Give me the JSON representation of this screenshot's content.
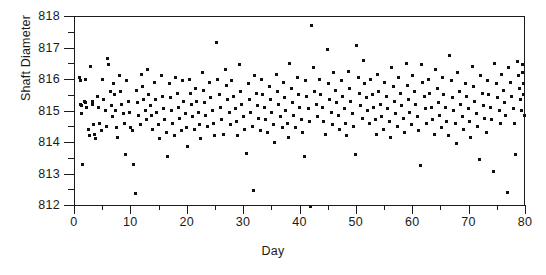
{
  "chart_data": {
    "type": "scatter",
    "title": "",
    "xlabel": "Day",
    "ylabel": "Shaft Diameter",
    "xlim": [
      0,
      80
    ],
    "ylim": [
      812,
      818
    ],
    "grid": false,
    "legend": null,
    "marker": "square",
    "marker_color": "#101010",
    "marker_size_px": 3,
    "xticks": [
      0,
      10,
      20,
      30,
      40,
      50,
      60,
      70,
      80
    ],
    "xtick_labels": [
      "0",
      "10",
      "20",
      "30",
      "40",
      "50",
      "60",
      "70",
      "80"
    ],
    "xminor_ticks": [
      5,
      15,
      25,
      35,
      45,
      55,
      65,
      75
    ],
    "yticks": [
      812,
      813,
      814,
      815,
      816,
      817,
      818
    ],
    "ytick_labels": [
      "812",
      "813",
      "814",
      "815",
      "816",
      "817",
      "818"
    ],
    "yminor_ticks": [
      812.5,
      813.5,
      814.5,
      815.5,
      816.5,
      817.5
    ],
    "points": [
      [
        1.0,
        816.05
      ],
      [
        1.1,
        815.95
      ],
      [
        1.2,
        815.2
      ],
      [
        1.3,
        815.15
      ],
      [
        1.4,
        814.9
      ],
      [
        1.5,
        813.3
      ],
      [
        1.8,
        815.3
      ],
      [
        2.0,
        816.0
      ],
      [
        2.1,
        815.25
      ],
      [
        2.3,
        815.1
      ],
      [
        2.5,
        814.4
      ],
      [
        2.7,
        814.2
      ],
      [
        3.0,
        816.4
      ],
      [
        3.2,
        815.3
      ],
      [
        3.3,
        815.2
      ],
      [
        3.5,
        814.55
      ],
      [
        3.7,
        814.25
      ],
      [
        3.9,
        814.1
      ],
      [
        4.2,
        815.45
      ],
      [
        4.4,
        815.1
      ],
      [
        4.6,
        814.6
      ],
      [
        4.8,
        814.35
      ],
      [
        5.0,
        816.0
      ],
      [
        5.2,
        815.35
      ],
      [
        5.5,
        815.0
      ],
      [
        5.7,
        814.5
      ],
      [
        6.0,
        816.65
      ],
      [
        6.2,
        816.45
      ],
      [
        6.4,
        815.6
      ],
      [
        6.6,
        815.15
      ],
      [
        6.8,
        814.8
      ],
      [
        7.0,
        815.85
      ],
      [
        7.2,
        815.5
      ],
      [
        7.4,
        815.0
      ],
      [
        7.6,
        814.45
      ],
      [
        7.8,
        814.15
      ],
      [
        8.0,
        816.1
      ],
      [
        8.3,
        815.6
      ],
      [
        8.5,
        815.2
      ],
      [
        8.7,
        814.9
      ],
      [
        8.9,
        814.6
      ],
      [
        9.1,
        813.6
      ],
      [
        9.4,
        815.95
      ],
      [
        9.6,
        815.3
      ],
      [
        9.8,
        814.95
      ],
      [
        10.0,
        814.45
      ],
      [
        10.3,
        814.35
      ],
      [
        10.6,
        813.3
      ],
      [
        10.9,
        812.35
      ],
      [
        11.1,
        815.65
      ],
      [
        11.3,
        815.25
      ],
      [
        11.5,
        814.85
      ],
      [
        11.8,
        814.55
      ],
      [
        12.0,
        816.15
      ],
      [
        12.2,
        815.75
      ],
      [
        12.4,
        815.35
      ],
      [
        12.6,
        815.0
      ],
      [
        12.8,
        814.7
      ],
      [
        13.0,
        816.3
      ],
      [
        13.3,
        815.5
      ],
      [
        13.5,
        815.15
      ],
      [
        13.7,
        814.85
      ],
      [
        13.9,
        814.4
      ],
      [
        14.2,
        815.9
      ],
      [
        14.5,
        815.35
      ],
      [
        14.7,
        814.95
      ],
      [
        15.0,
        814.55
      ],
      [
        15.2,
        814.1
      ],
      [
        15.5,
        816.1
      ],
      [
        15.7,
        815.45
      ],
      [
        15.9,
        815.05
      ],
      [
        16.1,
        814.7
      ],
      [
        16.4,
        814.3
      ],
      [
        16.6,
        813.55
      ],
      [
        16.9,
        815.85
      ],
      [
        17.1,
        815.4
      ],
      [
        17.3,
        815.0
      ],
      [
        17.5,
        814.6
      ],
      [
        17.8,
        814.2
      ],
      [
        18.0,
        816.05
      ],
      [
        18.3,
        815.55
      ],
      [
        18.5,
        815.1
      ],
      [
        18.7,
        814.75
      ],
      [
        19.0,
        814.35
      ],
      [
        19.3,
        815.95
      ],
      [
        19.5,
        815.3
      ],
      [
        19.7,
        814.9
      ],
      [
        19.9,
        814.45
      ],
      [
        20.1,
        813.85
      ],
      [
        20.4,
        816.0
      ],
      [
        20.6,
        815.55
      ],
      [
        20.8,
        815.2
      ],
      [
        21.0,
        814.8
      ],
      [
        21.3,
        814.4
      ],
      [
        21.6,
        815.7
      ],
      [
        21.8,
        815.3
      ],
      [
        22.0,
        814.95
      ],
      [
        22.2,
        814.55
      ],
      [
        22.5,
        814.1
      ],
      [
        22.8,
        816.2
      ],
      [
        23.0,
        815.65
      ],
      [
        23.2,
        815.25
      ],
      [
        23.4,
        814.85
      ],
      [
        23.7,
        814.5
      ],
      [
        24.0,
        815.9
      ],
      [
        24.3,
        815.4
      ],
      [
        24.5,
        815.0
      ],
      [
        24.7,
        814.6
      ],
      [
        25.0,
        814.2
      ],
      [
        25.3,
        817.15
      ],
      [
        25.5,
        816.0
      ],
      [
        25.8,
        815.5
      ],
      [
        26.0,
        815.1
      ],
      [
        26.2,
        814.7
      ],
      [
        26.5,
        814.25
      ],
      [
        26.8,
        816.3
      ],
      [
        27.0,
        815.8
      ],
      [
        27.3,
        815.35
      ],
      [
        27.5,
        814.95
      ],
      [
        27.8,
        814.55
      ],
      [
        28.0,
        815.95
      ],
      [
        28.3,
        815.45
      ],
      [
        28.6,
        815.05
      ],
      [
        28.8,
        814.65
      ],
      [
        29.0,
        814.2
      ],
      [
        29.3,
        816.45
      ],
      [
        29.6,
        815.6
      ],
      [
        29.8,
        815.2
      ],
      [
        30.0,
        814.8
      ],
      [
        30.3,
        814.4
      ],
      [
        30.6,
        813.65
      ],
      [
        30.9,
        815.85
      ],
      [
        31.1,
        815.35
      ],
      [
        31.3,
        814.95
      ],
      [
        31.6,
        814.5
      ],
      [
        31.8,
        812.45
      ],
      [
        32.0,
        816.1
      ],
      [
        32.3,
        815.55
      ],
      [
        32.5,
        815.15
      ],
      [
        32.8,
        814.75
      ],
      [
        33.0,
        814.35
      ],
      [
        33.3,
        816.0
      ],
      [
        33.5,
        815.5
      ],
      [
        33.8,
        815.1
      ],
      [
        34.0,
        814.7
      ],
      [
        34.3,
        814.3
      ],
      [
        34.6,
        815.75
      ],
      [
        34.8,
        815.35
      ],
      [
        35.0,
        814.95
      ],
      [
        35.3,
        814.55
      ],
      [
        35.6,
        814.0
      ],
      [
        35.9,
        816.15
      ],
      [
        36.1,
        815.6
      ],
      [
        36.3,
        815.2
      ],
      [
        36.6,
        814.8
      ],
      [
        36.9,
        814.45
      ],
      [
        37.1,
        815.9
      ],
      [
        37.4,
        815.4
      ],
      [
        37.6,
        815.0
      ],
      [
        37.8,
        814.6
      ],
      [
        38.0,
        814.15
      ],
      [
        38.3,
        816.5
      ],
      [
        38.6,
        815.7
      ],
      [
        38.8,
        815.25
      ],
      [
        39.0,
        814.85
      ],
      [
        39.3,
        814.45
      ],
      [
        39.6,
        816.05
      ],
      [
        39.8,
        815.5
      ],
      [
        40.0,
        815.1
      ],
      [
        40.3,
        814.7
      ],
      [
        40.6,
        814.3
      ],
      [
        40.9,
        813.55
      ],
      [
        41.1,
        815.95
      ],
      [
        41.3,
        815.45
      ],
      [
        41.6,
        815.05
      ],
      [
        41.8,
        814.65
      ],
      [
        42.0,
        811.95
      ],
      [
        42.2,
        817.7
      ],
      [
        42.5,
        816.35
      ],
      [
        42.7,
        815.6
      ],
      [
        43.0,
        815.2
      ],
      [
        43.2,
        814.8
      ],
      [
        43.5,
        816.0
      ],
      [
        43.8,
        815.5
      ],
      [
        44.0,
        815.1
      ],
      [
        44.3,
        814.65
      ],
      [
        44.6,
        814.25
      ],
      [
        44.9,
        816.95
      ],
      [
        45.1,
        815.85
      ],
      [
        45.4,
        815.35
      ],
      [
        45.6,
        814.95
      ],
      [
        45.9,
        814.55
      ],
      [
        46.1,
        816.2
      ],
      [
        46.4,
        815.65
      ],
      [
        46.6,
        815.25
      ],
      [
        46.9,
        814.85
      ],
      [
        47.1,
        814.4
      ],
      [
        47.4,
        815.95
      ],
      [
        47.6,
        815.45
      ],
      [
        47.9,
        815.05
      ],
      [
        48.1,
        814.6
      ],
      [
        48.4,
        814.2
      ],
      [
        48.7,
        816.25
      ],
      [
        48.9,
        815.7
      ],
      [
        49.1,
        815.3
      ],
      [
        49.4,
        814.9
      ],
      [
        49.6,
        814.5
      ],
      [
        49.9,
        813.6
      ],
      [
        50.1,
        817.05
      ],
      [
        50.4,
        816.05
      ],
      [
        50.6,
        815.55
      ],
      [
        50.9,
        815.15
      ],
      [
        51.1,
        814.75
      ],
      [
        51.4,
        816.6
      ],
      [
        51.6,
        815.85
      ],
      [
        51.9,
        815.4
      ],
      [
        52.1,
        815.0
      ],
      [
        52.4,
        814.6
      ],
      [
        52.6,
        816.0
      ],
      [
        52.9,
        815.5
      ],
      [
        53.1,
        815.1
      ],
      [
        53.4,
        814.7
      ],
      [
        53.6,
        814.25
      ],
      [
        53.9,
        816.15
      ],
      [
        54.1,
        815.6
      ],
      [
        54.4,
        815.2
      ],
      [
        54.6,
        814.8
      ],
      [
        54.9,
        814.4
      ],
      [
        55.1,
        815.9
      ],
      [
        55.4,
        815.45
      ],
      [
        55.6,
        815.05
      ],
      [
        55.9,
        814.65
      ],
      [
        56.1,
        814.15
      ],
      [
        56.4,
        816.35
      ],
      [
        56.6,
        815.75
      ],
      [
        56.9,
        815.3
      ],
      [
        57.1,
        814.9
      ],
      [
        57.4,
        814.5
      ],
      [
        57.6,
        816.05
      ],
      [
        57.9,
        815.55
      ],
      [
        58.1,
        815.15
      ],
      [
        58.4,
        814.75
      ],
      [
        58.6,
        814.3
      ],
      [
        58.9,
        816.5
      ],
      [
        59.1,
        815.8
      ],
      [
        59.4,
        815.35
      ],
      [
        59.6,
        814.95
      ],
      [
        59.9,
        814.55
      ],
      [
        60.1,
        816.1
      ],
      [
        60.4,
        815.6
      ],
      [
        60.6,
        815.2
      ],
      [
        60.9,
        814.8
      ],
      [
        61.1,
        814.35
      ],
      [
        61.4,
        813.25
      ],
      [
        61.6,
        816.45
      ],
      [
        61.9,
        815.9
      ],
      [
        62.1,
        815.45
      ],
      [
        62.4,
        815.05
      ],
      [
        62.6,
        814.6
      ],
      [
        62.9,
        816.0
      ],
      [
        63.1,
        815.55
      ],
      [
        63.4,
        815.1
      ],
      [
        63.6,
        814.7
      ],
      [
        63.9,
        814.25
      ],
      [
        64.1,
        816.3
      ],
      [
        64.4,
        815.7
      ],
      [
        64.6,
        815.25
      ],
      [
        64.9,
        814.85
      ],
      [
        65.1,
        814.45
      ],
      [
        65.4,
        816.05
      ],
      [
        65.6,
        815.5
      ],
      [
        65.9,
        815.1
      ],
      [
        66.1,
        814.65
      ],
      [
        66.4,
        814.2
      ],
      [
        66.6,
        816.75
      ],
      [
        66.9,
        815.95
      ],
      [
        67.1,
        815.4
      ],
      [
        67.4,
        815.0
      ],
      [
        67.6,
        814.6
      ],
      [
        67.9,
        813.95
      ],
      [
        68.1,
        816.2
      ],
      [
        68.4,
        815.6
      ],
      [
        68.6,
        815.2
      ],
      [
        68.9,
        814.8
      ],
      [
        69.1,
        814.4
      ],
      [
        69.4,
        815.85
      ],
      [
        69.6,
        815.45
      ],
      [
        69.9,
        815.05
      ],
      [
        70.1,
        814.65
      ],
      [
        70.4,
        814.15
      ],
      [
        70.6,
        816.4
      ],
      [
        70.9,
        815.75
      ],
      [
        71.1,
        815.3
      ],
      [
        71.4,
        814.9
      ],
      [
        71.6,
        814.5
      ],
      [
        71.9,
        813.45
      ],
      [
        72.1,
        816.1
      ],
      [
        72.4,
        815.55
      ],
      [
        72.6,
        815.15
      ],
      [
        72.9,
        814.75
      ],
      [
        73.1,
        814.3
      ],
      [
        73.4,
        815.95
      ],
      [
        73.6,
        815.5
      ],
      [
        73.9,
        815.1
      ],
      [
        74.1,
        814.7
      ],
      [
        74.4,
        813.05
      ],
      [
        74.6,
        816.5
      ],
      [
        74.9,
        815.85
      ],
      [
        75.1,
        815.4
      ],
      [
        75.4,
        815.0
      ],
      [
        75.6,
        814.6
      ],
      [
        75.9,
        816.15
      ],
      [
        76.1,
        815.65
      ],
      [
        76.4,
        815.25
      ],
      [
        76.6,
        814.85
      ],
      [
        76.9,
        812.4
      ],
      [
        77.1,
        816.35
      ],
      [
        77.4,
        815.9
      ],
      [
        77.6,
        815.45
      ],
      [
        77.9,
        815.05
      ],
      [
        78.1,
        814.6
      ],
      [
        78.4,
        813.6
      ],
      [
        78.6,
        816.55
      ],
      [
        78.9,
        816.1
      ],
      [
        79.0,
        815.7
      ],
      [
        79.2,
        815.35
      ],
      [
        79.4,
        815.0
      ],
      [
        79.5,
        816.45
      ],
      [
        79.6,
        816.2
      ],
      [
        79.7,
        815.85
      ],
      [
        79.8,
        815.5
      ],
      [
        79.9,
        814.85
      ]
    ]
  }
}
